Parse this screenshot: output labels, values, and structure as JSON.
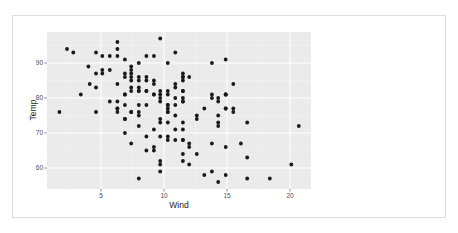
{
  "chart_data": {
    "type": "scatter",
    "title": "",
    "xlabel": "Wind",
    "ylabel": "Temp",
    "xlim": [
      1.7,
      20.7
    ],
    "ylim": [
      56,
      97
    ],
    "xticks": [
      5,
      10,
      15,
      20
    ],
    "yticks": [
      60,
      70,
      80,
      90
    ],
    "grid": true,
    "legend": null,
    "points": [
      [
        7.4,
        67
      ],
      [
        8.0,
        72
      ],
      [
        12.6,
        74
      ],
      [
        11.5,
        62
      ],
      [
        14.3,
        56
      ],
      [
        14.9,
        66
      ],
      [
        8.6,
        65
      ],
      [
        13.8,
        59
      ],
      [
        20.1,
        61
      ],
      [
        8.6,
        69
      ],
      [
        6.9,
        74
      ],
      [
        9.7,
        69
      ],
      [
        9.2,
        66
      ],
      [
        10.9,
        68
      ],
      [
        13.2,
        58
      ],
      [
        11.5,
        64
      ],
      [
        12.0,
        66
      ],
      [
        18.4,
        57
      ],
      [
        11.5,
        68
      ],
      [
        9.7,
        62
      ],
      [
        9.7,
        59
      ],
      [
        16.6,
        73
      ],
      [
        9.7,
        61
      ],
      [
        12.0,
        61
      ],
      [
        16.6,
        57
      ],
      [
        14.9,
        58
      ],
      [
        8.0,
        57
      ],
      [
        12.0,
        67
      ],
      [
        14.9,
        81
      ],
      [
        5.7,
        79
      ],
      [
        7.4,
        76
      ],
      [
        8.6,
        78
      ],
      [
        9.7,
        74
      ],
      [
        16.1,
        67
      ],
      [
        9.2,
        84
      ],
      [
        8.6,
        85
      ],
      [
        14.3,
        79
      ],
      [
        9.7,
        82
      ],
      [
        6.9,
        87
      ],
      [
        13.8,
        90
      ],
      [
        11.5,
        87
      ],
      [
        10.9,
        93
      ],
      [
        9.2,
        92
      ],
      [
        8.0,
        82
      ],
      [
        13.8,
        80
      ],
      [
        11.5,
        79
      ],
      [
        14.9,
        77
      ],
      [
        20.7,
        72
      ],
      [
        9.2,
        65
      ],
      [
        11.5,
        73
      ],
      [
        10.3,
        76
      ],
      [
        6.3,
        77
      ],
      [
        1.7,
        76
      ],
      [
        4.6,
        76
      ],
      [
        6.3,
        76
      ],
      [
        8.0,
        75
      ],
      [
        8.0,
        78
      ],
      [
        10.3,
        73
      ],
      [
        11.5,
        80
      ],
      [
        14.9,
        77
      ],
      [
        8.0,
        83
      ],
      [
        4.1,
        84
      ],
      [
        9.2,
        85
      ],
      [
        9.2,
        81
      ],
      [
        10.9,
        84
      ],
      [
        4.6,
        83
      ],
      [
        10.9,
        83
      ],
      [
        5.1,
        88
      ],
      [
        6.3,
        92
      ],
      [
        5.7,
        92
      ],
      [
        7.4,
        89
      ],
      [
        8.6,
        82
      ],
      [
        14.3,
        73
      ],
      [
        14.9,
        81
      ],
      [
        14.9,
        91
      ],
      [
        14.3,
        80
      ],
      [
        6.9,
        81
      ],
      [
        10.3,
        82
      ],
      [
        6.3,
        84
      ],
      [
        5.1,
        87
      ],
      [
        11.5,
        85
      ],
      [
        6.9,
        74
      ],
      [
        9.7,
        81
      ],
      [
        11.5,
        82
      ],
      [
        8.6,
        86
      ],
      [
        8.0,
        85
      ],
      [
        8.6,
        82
      ],
      [
        12.0,
        86
      ],
      [
        7.4,
        88
      ],
      [
        7.4,
        86
      ],
      [
        7.4,
        83
      ],
      [
        9.2,
        81
      ],
      [
        6.9,
        81
      ],
      [
        13.8,
        81
      ],
      [
        7.4,
        82
      ],
      [
        6.9,
        86
      ],
      [
        7.4,
        85
      ],
      [
        4.6,
        87
      ],
      [
        4.0,
        89
      ],
      [
        10.3,
        90
      ],
      [
        8.0,
        90
      ],
      [
        8.6,
        92
      ],
      [
        11.5,
        86
      ],
      [
        11.5,
        86
      ],
      [
        11.5,
        82
      ],
      [
        9.7,
        80
      ],
      [
        11.5,
        79
      ],
      [
        10.3,
        77
      ],
      [
        6.3,
        79
      ],
      [
        7.4,
        76
      ],
      [
        10.9,
        78
      ],
      [
        10.3,
        78
      ],
      [
        15.5,
        77
      ],
      [
        14.3,
        72
      ],
      [
        12.6,
        75
      ],
      [
        9.7,
        79
      ],
      [
        3.4,
        81
      ],
      [
        8.0,
        86
      ],
      [
        5.7,
        88
      ],
      [
        9.7,
        97
      ],
      [
        2.3,
        94
      ],
      [
        6.3,
        96
      ],
      [
        6.3,
        94
      ],
      [
        6.9,
        91
      ],
      [
        5.1,
        92
      ],
      [
        2.8,
        93
      ],
      [
        4.6,
        93
      ],
      [
        7.4,
        87
      ],
      [
        15.5,
        84
      ],
      [
        10.9,
        80
      ],
      [
        10.3,
        78
      ],
      [
        10.9,
        75
      ],
      [
        9.7,
        73
      ],
      [
        14.9,
        81
      ],
      [
        15.5,
        76
      ],
      [
        6.3,
        77
      ],
      [
        10.9,
        71
      ],
      [
        11.5,
        71
      ],
      [
        6.9,
        78
      ],
      [
        13.8,
        67
      ],
      [
        10.3,
        76
      ],
      [
        10.3,
        68
      ],
      [
        8.0,
        82
      ],
      [
        12.6,
        64
      ],
      [
        9.2,
        71
      ],
      [
        10.3,
        81
      ],
      [
        10.3,
        69
      ],
      [
        16.6,
        63
      ],
      [
        6.9,
        70
      ],
      [
        13.2,
        77
      ],
      [
        14.3,
        75
      ],
      [
        8.0,
        76
      ],
      [
        11.5,
        68
      ]
    ]
  },
  "axes": {
    "x_title": "Wind",
    "y_title": "Temp",
    "x_tick_labels": [
      "5",
      "10",
      "15",
      "20"
    ],
    "y_tick_labels": [
      "60",
      "70",
      "80",
      "90"
    ]
  },
  "colors": {
    "panel_bg": "#ebebeb",
    "grid_major": "#ffffff",
    "grid_minor": "#f5f5f5",
    "point": "#1a1a1a",
    "tick_text": "#4d4d4d",
    "axis_title": "#222222",
    "frame_border": "#dcdcdc"
  }
}
